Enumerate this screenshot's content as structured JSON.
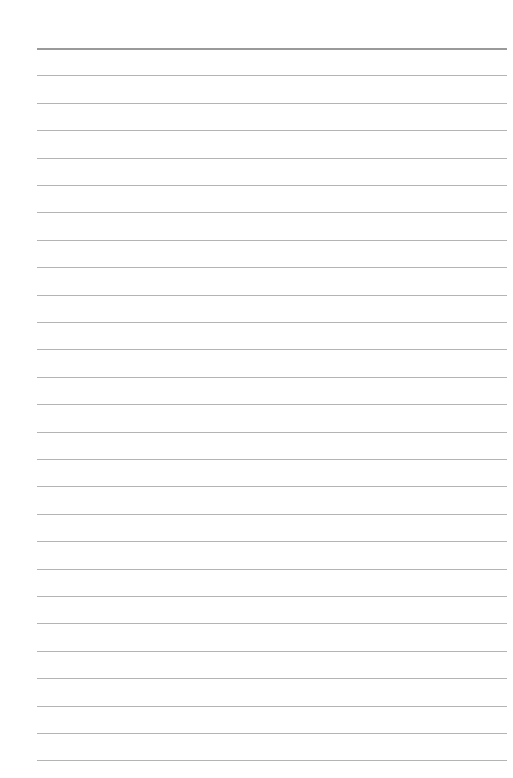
{
  "page": {
    "type": "lined-paper",
    "background_color": "#ffffff",
    "line_color": "#b4b4b4",
    "header_line_color": "#9a9a9a",
    "line_count": 27,
    "first_line_y": 48,
    "line_spacing": 27.4,
    "line_left": 37,
    "line_right": 507
  }
}
